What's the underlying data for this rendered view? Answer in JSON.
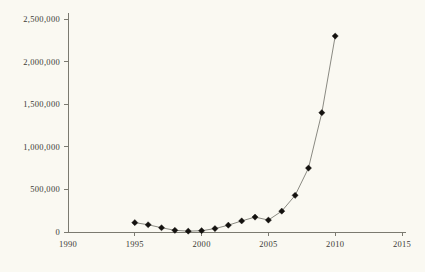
{
  "chart_data": {
    "type": "line",
    "title": "",
    "subtitle": "",
    "xlabel": "",
    "ylabel": "",
    "xlim": [
      1990,
      2015
    ],
    "ylim": [
      0,
      2500000
    ],
    "grid": false,
    "legend": null,
    "x_ticks": [
      1990,
      1995,
      2000,
      2005,
      2010,
      2015
    ],
    "x_tick_labels": [
      "1990",
      "1995",
      "2000",
      "2005",
      "2010",
      "2015"
    ],
    "y_ticks": [
      0,
      500000,
      1000000,
      1500000,
      2000000,
      2500000
    ],
    "y_tick_labels": [
      "0",
      "500,000",
      "1,000,000",
      "1,500,000",
      "2,000,000",
      "2,500,000"
    ],
    "marker": "diamond",
    "marker_color": "#14120f",
    "line_color": "#8a8a82",
    "background_color": "#faf9f2",
    "axis_color": "#7b7a70",
    "x": [
      1995,
      1996,
      1997,
      1998,
      1999,
      2000,
      2001,
      2002,
      2003,
      2004,
      2005,
      2006,
      2007,
      2008,
      2009,
      2010
    ],
    "values": [
      110000,
      85000,
      50000,
      20000,
      10000,
      15000,
      40000,
      80000,
      130000,
      175000,
      140000,
      245000,
      430000,
      750000,
      1400000,
      2300000
    ],
    "series": [
      {
        "name": "",
        "x": [
          1995,
          1996,
          1997,
          1998,
          1999,
          2000,
          2001,
          2002,
          2003,
          2004,
          2005,
          2006,
          2007,
          2008,
          2009,
          2010
        ],
        "values": [
          110000,
          85000,
          50000,
          20000,
          10000,
          15000,
          40000,
          80000,
          130000,
          175000,
          140000,
          245000,
          430000,
          750000,
          1400000,
          2300000
        ]
      }
    ]
  }
}
